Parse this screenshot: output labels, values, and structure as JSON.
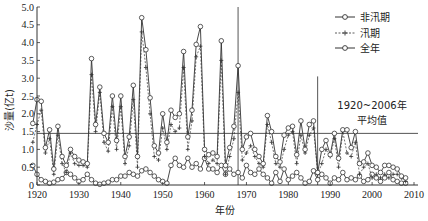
{
  "chart_data": {
    "type": "line",
    "title": "",
    "xlabel": "年份",
    "ylabel": "沙量(亿t)",
    "xlim": [
      1920,
      2010
    ],
    "ylim": [
      0,
      5.0
    ],
    "xticks": [
      1920,
      1930,
      1940,
      1950,
      1960,
      1970,
      1980,
      1990,
      2000,
      2010
    ],
    "yticks": [
      0,
      0.5,
      1.0,
      1.5,
      2.0,
      2.5,
      3.0,
      3.5,
      4.0,
      4.5,
      5.0
    ],
    "ytick_labels": [
      "0",
      "0.5",
      "1.0",
      "1.5",
      "2.0",
      "2.5",
      "3.0",
      "3.5",
      "4.0",
      "4.5",
      "5.0"
    ],
    "grid": false,
    "legend_position": "upper right",
    "x": [
      1919,
      1920,
      1921,
      1922,
      1923,
      1924,
      1925,
      1926,
      1927,
      1928,
      1929,
      1930,
      1931,
      1932,
      1933,
      1934,
      1935,
      1936,
      1937,
      1938,
      1939,
      1940,
      1941,
      1942,
      1943,
      1944,
      1945,
      1946,
      1947,
      1948,
      1949,
      1950,
      1951,
      1952,
      1953,
      1954,
      1955,
      1956,
      1957,
      1958,
      1959,
      1960,
      1961,
      1962,
      1963,
      1964,
      1965,
      1966,
      1967,
      1968,
      1969,
      1970,
      1971,
      1972,
      1973,
      1974,
      1975,
      1976,
      1977,
      1978,
      1979,
      1980,
      1981,
      1982,
      1983,
      1984,
      1985,
      1986,
      1987,
      1988,
      1989,
      1990,
      1991,
      1992,
      1993,
      1994,
      1995,
      1996,
      1997,
      1998,
      1999,
      2000,
      2001,
      2002,
      2003,
      2004,
      2005,
      2006,
      2007,
      2008
    ],
    "series": [
      {
        "name": "非汛期",
        "marker": "circle",
        "linestyle": "solid",
        "values": [
          0.55,
          0.3,
          0.15,
          0.1,
          0.05,
          0.08,
          0.15,
          0.18,
          0.35,
          0.3,
          0.2,
          0.1,
          0.15,
          0.3,
          0.15,
          0.05,
          0.02,
          0.05,
          0.08,
          0.15,
          0.15,
          0.25,
          0.25,
          0.35,
          0.3,
          0.25,
          0.4,
          0.45,
          0.35,
          0.25,
          0.15,
          0.1,
          0.05,
          0.55,
          0.75,
          0.55,
          0.5,
          0.75,
          0.5,
          0.6,
          0.45,
          0.75,
          0.45,
          0.45,
          0.35,
          0.55,
          0.3,
          0.45,
          0.3,
          0.35,
          0.2,
          0.55,
          0.35,
          0.3,
          0.45,
          0.3,
          0.2,
          0.05,
          0.35,
          0.1,
          0.45,
          0.15,
          0.25,
          0.35,
          0.2,
          0.05,
          0.1,
          0.4,
          0.15,
          0.3,
          0.2,
          0.05,
          0.2,
          0.15,
          0.35,
          0.15,
          0.2,
          0.15,
          0.25,
          0.1,
          0.15,
          0.3,
          0.2,
          0.1,
          0.2,
          0.35,
          0.15,
          0.1,
          0.05,
          0.05
        ]
      },
      {
        "name": "汛期",
        "marker": "plus",
        "linestyle": "dashed",
        "values": [
          1.2,
          1.7,
          2.1,
          0.9,
          1.3,
          0.3,
          1.4,
          0.6,
          0.35,
          0.9,
          0.6,
          0.55,
          0.55,
          0.5,
          3.1,
          1.5,
          2.6,
          1.2,
          0.95,
          2.2,
          1.0,
          2.2,
          0.6,
          1.1,
          2.4,
          0.5,
          4.3,
          3.3,
          2.0,
          0.8,
          0.7,
          1.6,
          1.0,
          1.7,
          1.5,
          1.6,
          3.3,
          1.0,
          1.8,
          3.6,
          3.9,
          0.8,
          0.6,
          0.7,
          0.6,
          3.5,
          0.3,
          0.8,
          1.3,
          2.6,
          0.7,
          0.9,
          1.1,
          0.8,
          0.6,
          0.5,
          1.7,
          1.2,
          0.6,
          0.5,
          1.0,
          1.4,
          1.5,
          0.6,
          1.4,
          0.9,
          1.4,
          1.6,
          0.3,
          0.6,
          1.0,
          0.8,
          1.3,
          0.5,
          1.5,
          0.9,
          0.8,
          1.2,
          0.3,
          0.5,
          0.6,
          0.2,
          0.3,
          0.2,
          0.3,
          0.2,
          0.3,
          0.3,
          0.2,
          0.1
        ]
      },
      {
        "name": "全年",
        "marker": "circle",
        "linestyle": "solid",
        "values": [
          1.73,
          2.4,
          2.35,
          1.05,
          1.55,
          0.45,
          1.65,
          0.8,
          0.55,
          1.0,
          0.8,
          0.7,
          0.65,
          0.6,
          3.55,
          1.7,
          2.75,
          1.45,
          1.2,
          2.5,
          1.25,
          2.5,
          0.8,
          1.35,
          2.8,
          0.8,
          4.7,
          3.8,
          2.45,
          1.1,
          0.9,
          2.0,
          1.2,
          2.1,
          1.9,
          2.0,
          3.75,
          1.35,
          2.1,
          3.95,
          4.45,
          1.0,
          0.85,
          0.9,
          0.8,
          4.05,
          0.55,
          1.05,
          1.65,
          3.35,
          1.0,
          1.35,
          1.45,
          1.0,
          0.8,
          0.6,
          1.95,
          1.5,
          0.8,
          0.65,
          1.4,
          1.6,
          1.65,
          0.85,
          1.8,
          1.0,
          1.7,
          1.8,
          0.35,
          1.0,
          1.25,
          0.85,
          1.45,
          0.75,
          1.55,
          1.55,
          1.05,
          1.5,
          0.6,
          0.65,
          0.9,
          0.55,
          0.5,
          0.35,
          0.55,
          0.55,
          0.5,
          0.45,
          0.25,
          0.2
        ]
      }
    ],
    "reference_lines": {
      "horizontal": [
        {
          "y": 1.45,
          "label": "1920~2006年平均值"
        }
      ],
      "vertical": [
        {
          "x": 1968,
          "ymax": 5.0
        },
        {
          "x": 1987,
          "ymax": 3.05
        }
      ]
    },
    "annotation": {
      "line1": "1920~2006年",
      "line2": "平均值"
    },
    "legend": [
      {
        "label": "非汛期",
        "style": "solid-circle"
      },
      {
        "label": "汛期",
        "style": "dashed-plus"
      },
      {
        "label": "全年",
        "style": "solid-circle"
      }
    ]
  },
  "colors": {
    "line": "#333333",
    "axis": "#333333",
    "refline": "#555555",
    "background": "#ffffff"
  }
}
